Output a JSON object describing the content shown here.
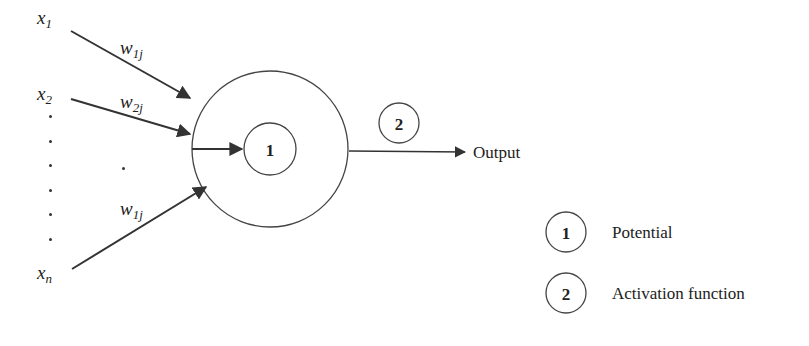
{
  "diagram": {
    "type": "artificial-neuron-model",
    "inputs": [
      {
        "name": "x",
        "sub": "1"
      },
      {
        "name": "x",
        "sub": "2"
      },
      {
        "name": "x",
        "sub": "n"
      }
    ],
    "weights": [
      {
        "name": "w",
        "sub": "1j"
      },
      {
        "name": "w",
        "sub": "2j"
      },
      {
        "name": "w",
        "sub": "1j"
      }
    ],
    "neuron": {
      "inner_label": "1",
      "activation_label": "2"
    },
    "output_label": "Output",
    "legend": [
      {
        "num": "1",
        "text": "Potential"
      },
      {
        "num": "2",
        "text": "Activation function"
      }
    ],
    "colors": {
      "stroke": "#333333",
      "text": "#222222",
      "background": "#ffffff"
    }
  }
}
